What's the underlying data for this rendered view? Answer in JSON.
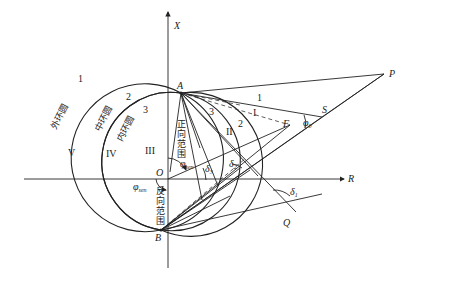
{
  "diagram": {
    "axes": {
      "vertical": "X",
      "horizontal": "R",
      "origin": "O"
    },
    "points": {
      "A": "A",
      "B": "B",
      "P": "P",
      "S": "S",
      "F": "F",
      "Q": "Q"
    },
    "left_circles": [
      {
        "num": "1",
        "name": "外环圆",
        "region": "V"
      },
      {
        "num": "2",
        "name": "中环圆",
        "region": "IV"
      },
      {
        "num": "3",
        "name": "内环圆",
        "region": "III"
      }
    ],
    "right_circles": [
      {
        "num": "1",
        "region": "I"
      },
      {
        "num": "2",
        "region": "II"
      },
      {
        "num": "3"
      }
    ],
    "ranges": {
      "forward": [
        "正",
        "向",
        "范",
        "围"
      ],
      "reverse": [
        "反",
        "向",
        "范",
        "围"
      ]
    },
    "angles": {
      "phi_sen_top": {
        "base": "φ",
        "sub": "sen"
      },
      "phi_sen_bottom": {
        "base": "φ",
        "sub": "sen"
      },
      "phi0": {
        "base": "φ",
        "sub": "0"
      },
      "delta1": {
        "base": "δ",
        "sub": "1"
      },
      "delta2": {
        "base": "δ",
        "sub": "2"
      },
      "delta3": {
        "base": "δ",
        "sub": "3"
      }
    }
  }
}
